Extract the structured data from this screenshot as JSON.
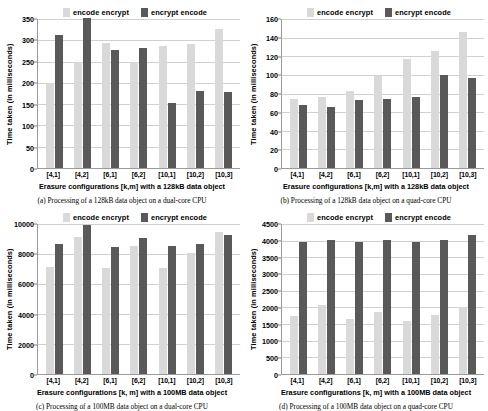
{
  "legend": {
    "series1_label": "encode encrypt",
    "series2_label": "encrypt encode",
    "series1_color": "#d9d9d9",
    "series2_color": "#595959"
  },
  "panels": [
    {
      "id": "a",
      "caption": "(a) Processing of a 128kB data object on a dual-core CPU",
      "chart_data": {
        "type": "bar",
        "title": "",
        "categories": [
          "[4,1]",
          "[4,2]",
          "[6,1]",
          "[6,2]",
          "[10,1]",
          "[10,2]",
          "[10,3]"
        ],
        "series": [
          {
            "name": "encode encrypt",
            "values": [
              199,
              250,
              294,
              249,
              287,
              292,
              327
            ]
          },
          {
            "name": "encrypt encode",
            "values": [
              312,
              352,
              278,
              282,
              153,
              180,
              178
            ]
          }
        ],
        "xlabel": "Erasure configurations [k,m] with a 128kB data object",
        "ylabel": "Time taken (in milliseconds)",
        "ylim": [
          0,
          350
        ],
        "ytick_step": 50,
        "yticks": [
          0,
          50,
          100,
          150,
          200,
          250,
          300,
          350
        ],
        "grid": true,
        "legend_position": "top"
      }
    },
    {
      "id": "b",
      "caption": "(b) Processing of a 128kB data object on a quad-core CPU",
      "chart_data": {
        "type": "bar",
        "title": "",
        "categories": [
          "[4,1]",
          "[4,2]",
          "[6,1]",
          "[6,2]",
          "[10,1]",
          "[10,2]",
          "[10,3]"
        ],
        "series": [
          {
            "name": "encode encrypt",
            "values": [
              74,
              76,
              83,
              99,
              117,
              126,
              146
            ]
          },
          {
            "name": "encrypt encode",
            "values": [
              68,
              66,
              73,
              74,
              76,
              100,
              97
            ]
          }
        ],
        "xlabel": "Erasure configurations [k,m] with a 128kB data object",
        "ylabel": "Time taken (in milliseconds)",
        "ylim": [
          0,
          160
        ],
        "ytick_step": 20,
        "yticks": [
          0,
          20,
          40,
          60,
          80,
          100,
          120,
          140,
          160
        ],
        "grid": true,
        "legend_position": "top"
      }
    },
    {
      "id": "c",
      "caption": "(c) Processing of a 100MB data object on a dual-core CPU",
      "chart_data": {
        "type": "bar",
        "title": "",
        "categories": [
          "[4,1]",
          "[4,2]",
          "[6,1]",
          "[6,2]",
          "[10,1]",
          "[10,2]",
          "[10,3]"
        ],
        "series": [
          {
            "name": "encode encrypt",
            "values": [
              7150,
              9150,
              7100,
              8550,
              7050,
              8100,
              9500
            ]
          },
          {
            "name": "encrypt encode",
            "values": [
              8700,
              9950,
              8500,
              9050,
              8550,
              8700,
              9300
            ]
          }
        ],
        "xlabel": "Erasure configurations [k, m] with a 100MB data object",
        "ylabel": "Time taken (in milliseconds)",
        "ylim": [
          0,
          10000
        ],
        "ytick_step": 2000,
        "yticks": [
          0,
          2000,
          4000,
          6000,
          8000,
          10000
        ],
        "grid": true,
        "legend_position": "top"
      }
    },
    {
      "id": "d",
      "caption": "(d) Processing of a 100MB data object on a quad-core CPU",
      "chart_data": {
        "type": "bar",
        "title": "",
        "categories": [
          "[4,1]",
          "[4,2]",
          "[6,1]",
          "[6,2]",
          "[10,1]",
          "[10,2]",
          "[10,3]"
        ],
        "series": [
          {
            "name": "encode encrypt",
            "values": [
              1750,
              2080,
              1640,
              1860,
              1600,
              1760,
              2000
            ]
          },
          {
            "name": "encrypt encode",
            "values": [
              3960,
              4010,
              3960,
              4010,
              3970,
              4020,
              4160
            ]
          }
        ],
        "xlabel": "Erasure configurations [k, m] with a 100MB data object",
        "ylabel": "Time taken (in milliseconds)",
        "ylim": [
          0,
          4500
        ],
        "ytick_step": 500,
        "yticks": [
          0,
          500,
          1000,
          1500,
          2000,
          2500,
          3000,
          3500,
          4000,
          4500
        ],
        "grid": true,
        "legend_position": "top"
      }
    }
  ]
}
